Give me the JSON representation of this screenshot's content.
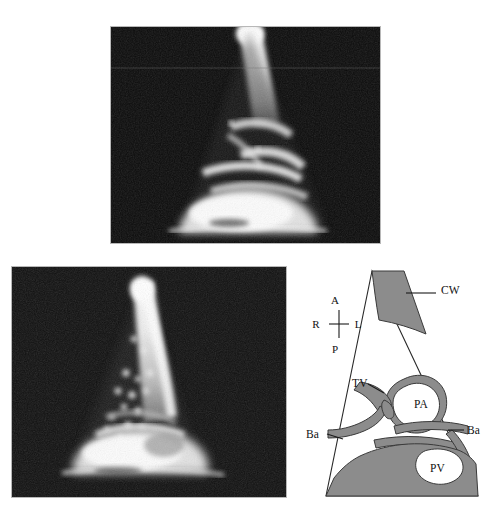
{
  "figure": {
    "kind": "medical-ultrasound-figure",
    "background_color": "#ffffff",
    "panel_count": 3
  },
  "panels": {
    "top_ultrasound": {
      "name": "top-ultrasound-image",
      "modality": "B-mode sector ultrasound scan",
      "frame": {
        "x": 111,
        "y": 27,
        "w": 269,
        "h": 216
      },
      "background_color": "#0d0d0d",
      "echo_color": "#f2f2f2",
      "description": "Sector scan showing bright near-field beam and layered echogenic structures"
    },
    "bottom_ultrasound": {
      "name": "bottom-left-ultrasound-image",
      "modality": "B-mode sector ultrasound scan",
      "frame": {
        "x": 12,
        "y": 267,
        "w": 274,
        "h": 230
      },
      "background_color": "#0d0d0d",
      "echo_color": "#f2f2f2",
      "description": "Sector scan with speckled mid-field echoes and bright far-field band"
    },
    "diagram": {
      "name": "anatomical-line-diagram",
      "frame": {
        "x": 300,
        "y": 260,
        "w": 190,
        "h": 255
      },
      "sector": {
        "apex_x": 372,
        "apex_y": 271,
        "base_left_x": 326,
        "base_right_x": 478,
        "base_y": 496
      },
      "outline_color": "#2a2a2a",
      "shade_color": "#8c8c8c",
      "lumen_color": "#ffffff"
    }
  },
  "orientation_marker": {
    "name": "orientation-cross",
    "anterior": "A",
    "posterior": "P",
    "right": "R",
    "left": "L",
    "center": {
      "x": 89,
      "y": 64
    }
  },
  "diagram_labels": [
    {
      "id": "cw",
      "text": "CW",
      "meaning": "chest wall",
      "x": 141,
      "y": 34,
      "leader": true
    },
    {
      "id": "tv",
      "text": "TV",
      "meaning": "transverse vessel",
      "x": 52,
      "y": 127,
      "leader": true
    },
    {
      "id": "pa",
      "text": "PA",
      "meaning": "pulmonary artery",
      "x": 114,
      "y": 143,
      "leader": false
    },
    {
      "id": "ba_l",
      "text": "Ba",
      "meaning": "branch artery",
      "x": 8,
      "y": 177,
      "leader": true
    },
    {
      "id": "ba_r",
      "text": "Ba",
      "meaning": "branch artery",
      "x": 167,
      "y": 169,
      "leader": true
    },
    {
      "id": "pv",
      "text": "PV",
      "meaning": "pulmonary vein",
      "x": 142,
      "y": 206,
      "leader": false
    }
  ],
  "legend_terms": {
    "CW": "chest wall",
    "TV": "transverse vessel",
    "PA": "pulmonary artery",
    "Ba": "branch artery",
    "PV": "pulmonary vein",
    "A": "anterior",
    "P": "posterior",
    "R": "right",
    "L": "left"
  }
}
